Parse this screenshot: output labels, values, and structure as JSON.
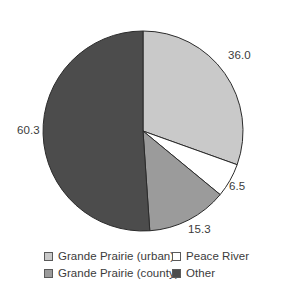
{
  "chart_data": {
    "type": "pie",
    "title": "",
    "subtitle": "",
    "xlabel": "",
    "ylabel": "",
    "grid": false,
    "legend_position": "bottom",
    "start_angle_deg": 0,
    "direction": "clockwise",
    "center": {
      "x": 143,
      "y": 131
    },
    "radius": 100,
    "total": 118.1,
    "categories": [
      "Grande Prairie (urban)",
      "Peace River",
      "Grande Prairie (county)",
      "Other"
    ],
    "values": [
      36.0,
      6.5,
      15.3,
      60.3
    ],
    "labels": [
      "36.0",
      "6.5",
      "15.3",
      "60.3"
    ],
    "colors": [
      "#c9c9c9",
      "#ffffff",
      "#9b9b9b",
      "#4c4c4c"
    ],
    "slices": [
      {
        "name": "Grande Prairie (urban)",
        "value": 36.0,
        "label": "36.0",
        "color": "#c9c9c9",
        "start_deg": 0.0,
        "end_deg": 109.7,
        "label_x": 228,
        "label_y": 50
      },
      {
        "name": "Peace River",
        "value": 6.5,
        "label": "6.5",
        "color": "#ffffff",
        "start_deg": 109.7,
        "end_deg": 129.5,
        "label_x": 229,
        "label_y": 181
      },
      {
        "name": "Grande Prairie (county)",
        "value": 15.3,
        "label": "15.3",
        "color": "#9b9b9b",
        "start_deg": 129.5,
        "end_deg": 176.1,
        "label_x": 188,
        "label_y": 224
      },
      {
        "name": "Other",
        "value": 60.3,
        "label": "60.3",
        "color": "#4c4c4c",
        "start_deg": 176.1,
        "end_deg": 360.0,
        "label_x": 17,
        "label_y": 125
      }
    ],
    "outline_color": "#2b2b2b"
  },
  "legend": {
    "entries": [
      {
        "label": "Grande Prairie (urban)",
        "color": "#c9c9c9"
      },
      {
        "label": "Peace River",
        "color": "#ffffff"
      },
      {
        "label": "Grande Prairie (county)",
        "color": "#9b9b9b"
      },
      {
        "label": "Other",
        "color": "#4c4c4c"
      }
    ]
  }
}
